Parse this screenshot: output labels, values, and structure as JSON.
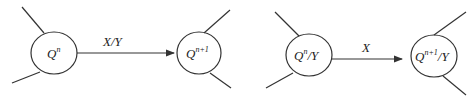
{
  "diagrams": [
    {
      "name": "left-transition",
      "source_state": {
        "base": "Q",
        "sup": "n",
        "suffix": ""
      },
      "target_state": {
        "base": "Q",
        "sup": "n+1",
        "suffix": ""
      },
      "edge_label": "X/Y"
    },
    {
      "name": "right-transition",
      "source_state": {
        "base": "Q",
        "sup": "n",
        "suffix": "/Y"
      },
      "target_state": {
        "base": "Q",
        "sup": "n+1",
        "suffix": "/Y"
      },
      "edge_label": "X"
    }
  ],
  "colors": {
    "stroke": "#333333",
    "text": "#222222",
    "background": "#ffffff"
  }
}
